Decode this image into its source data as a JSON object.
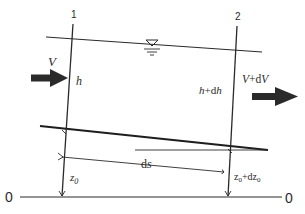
{
  "diagram": {
    "type": "open-channel-flow-element",
    "sections": [
      {
        "id": "section-1",
        "label": "1"
      },
      {
        "id": "section-2",
        "label": "2"
      }
    ],
    "labels": {
      "velocity_in": "V",
      "velocity_out": "V+dV",
      "depth_in": "h",
      "depth_out": "h+dh",
      "distance": "ds",
      "bed_elev_in": "z",
      "bed_elev_in_sub": "0",
      "bed_elev_out": "z",
      "bed_elev_out_sub": "0",
      "bed_elev_out_plus": "+dz",
      "bed_elev_out_plus_sub": "0",
      "datum_left": "0",
      "datum_right": "0"
    },
    "symbols": {
      "water_surface": "free-surface-triangle"
    },
    "colors": {
      "line": "#2a2a2a",
      "arrow": "#2a2a2a",
      "background": "#ffffff"
    }
  }
}
